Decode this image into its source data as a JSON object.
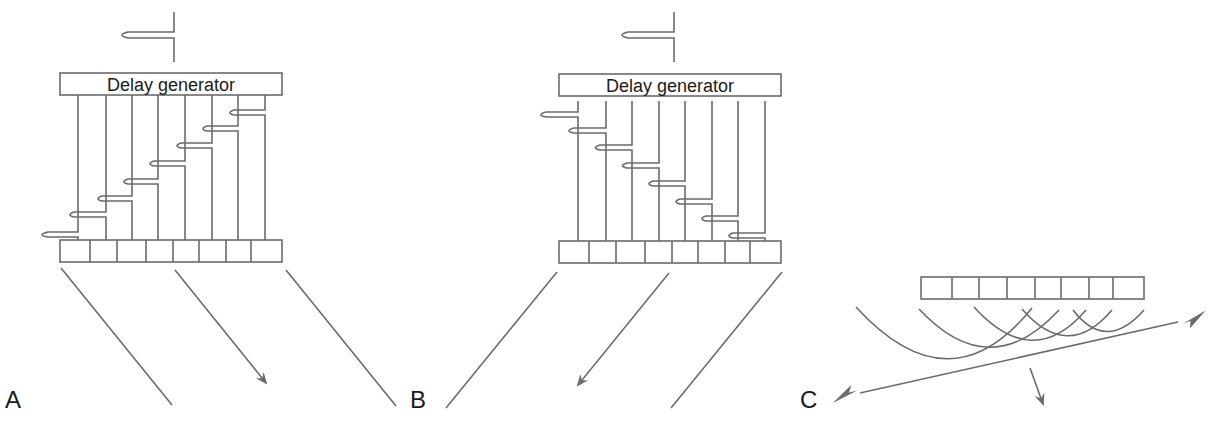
{
  "figure": {
    "colors": {
      "line": "#6b6b6b",
      "text": "#1a1a1a",
      "background": "#ffffff"
    },
    "panels": [
      {
        "id": "A",
        "label": "A",
        "delay_box_label": "Delay generator",
        "element_count": 8,
        "steering": "down-right",
        "wavefront_arrow": "down-right"
      },
      {
        "id": "B",
        "label": "B",
        "delay_box_label": "Delay generator",
        "element_count": 8,
        "steering": "down-left",
        "wavefront_arrow": "down-left"
      },
      {
        "id": "C",
        "label": "C",
        "element_count": 8,
        "wavefront": "curved wavelets combining into an oblique plane wave",
        "wavefront_arrow": "down"
      }
    ]
  }
}
